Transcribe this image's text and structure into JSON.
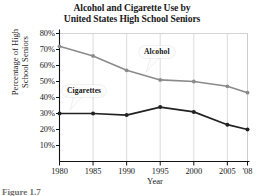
{
  "chart_data": {
    "type": "line",
    "title": "Alcohol and Cigarette Use by United States High School Seniors",
    "title_lines": [
      "Alcohol and Cigarette Use by",
      "United States High School Seniors"
    ],
    "xlabel": "Year",
    "ylabel": "Percentage of High School Seniors",
    "ylabel_lines": [
      "Percentage of High",
      "School Seniors"
    ],
    "categories": [
      "1980",
      "1985",
      "1990",
      "1995",
      "2000",
      "2005",
      "'08"
    ],
    "x": [
      1980,
      1985,
      1990,
      1995,
      2000,
      2005,
      2008
    ],
    "series": [
      {
        "name": "Alcohol",
        "color": "#8a8a8a",
        "values": [
          72,
          66,
          57,
          51,
          50,
          47,
          43
        ]
      },
      {
        "name": "Cigarettes",
        "color": "#222222",
        "values": [
          30,
          30,
          29,
          34,
          31,
          23,
          20
        ]
      }
    ],
    "ylim": [
      0,
      80
    ],
    "xlim": [
      1980,
      2008
    ],
    "ytick_labels": [
      "80%",
      "70%",
      "60%",
      "50%",
      "40%",
      "30%",
      "20%",
      "10%"
    ],
    "ytick_values": [
      80,
      70,
      60,
      50,
      40,
      30,
      20,
      10
    ],
    "grid": "vertical-light",
    "legend_position": "inline-callouts",
    "annotations": [
      {
        "text": "Alcohol",
        "target_series": "Alcohol"
      },
      {
        "text": "Cigarettes",
        "target_series": "Cigarettes"
      }
    ]
  },
  "caption": "Figure 1.7"
}
